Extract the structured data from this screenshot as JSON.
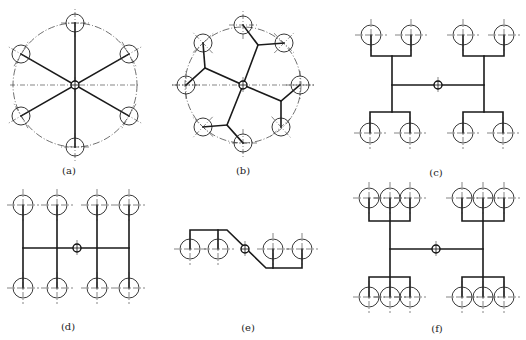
{
  "figure": {
    "title_cutoff": "",
    "panels": [
      {
        "id": "a",
        "label": "(a)",
        "label_pos": [
          69,
          170
        ],
        "type": "radial",
        "hub": [
          75,
          85
        ],
        "pcd_radius": 62,
        "center_line": {
          "x1": 10,
          "x2": 140,
          "y": 85
        },
        "outlets": [
          [
            75,
            23
          ],
          [
            129,
            54
          ],
          [
            129,
            116
          ],
          [
            75,
            147
          ],
          [
            21,
            116
          ],
          [
            21,
            54
          ]
        ],
        "branches": [
          [
            [
              75,
              85
            ],
            [
              75,
              23
            ]
          ],
          [
            [
              75,
              85
            ],
            [
              129,
              54
            ]
          ],
          [
            [
              75,
              85
            ],
            [
              129,
              116
            ]
          ],
          [
            [
              75,
              85
            ],
            [
              75,
              147
            ]
          ],
          [
            [
              75,
              85
            ],
            [
              21,
              116
            ]
          ],
          [
            [
              75,
              85
            ],
            [
              21,
              54
            ]
          ]
        ]
      },
      {
        "id": "b",
        "label": "(b)",
        "label_pos": [
          243,
          170
        ],
        "type": "radial-branched",
        "hub": [
          243,
          85
        ],
        "pcd_radius": 58,
        "center_line": {
          "x1": 172,
          "x2": 314,
          "y": 85
        },
        "outlets": [
          [
            243,
            25
          ],
          [
            284,
            43
          ],
          [
            300,
            85
          ],
          [
            281,
            127
          ],
          [
            243,
            143
          ],
          [
            203,
            127
          ],
          [
            186,
            85
          ],
          [
            203,
            43
          ]
        ],
        "branches": [
          [
            [
              243,
              85
            ],
            [
              258,
              45
            ],
            [
              243,
              25
            ]
          ],
          [
            [
              258,
              45
            ],
            [
              284,
              43
            ]
          ],
          [
            [
              243,
              85
            ],
            [
              281,
              101
            ],
            [
              300,
              85
            ]
          ],
          [
            [
              281,
              101
            ],
            [
              281,
              127
            ]
          ],
          [
            [
              243,
              85
            ],
            [
              227,
              125
            ],
            [
              243,
              143
            ]
          ],
          [
            [
              227,
              125
            ],
            [
              203,
              127
            ]
          ],
          [
            [
              243,
              85
            ],
            [
              205,
              68
            ],
            [
              186,
              85
            ]
          ],
          [
            [
              205,
              68
            ],
            [
              203,
              43
            ]
          ]
        ]
      },
      {
        "id": "c",
        "label": "(c)",
        "label_pos": [
          436,
          172
        ],
        "type": "H-tree-4x2",
        "hub": [
          438,
          85
        ],
        "outlets": [
          [
            371,
            35
          ],
          [
            411,
            35
          ],
          [
            463,
            35
          ],
          [
            504,
            35
          ],
          [
            370,
            133
          ],
          [
            410,
            133
          ],
          [
            463,
            133
          ],
          [
            503,
            133
          ]
        ],
        "branches": [
          [
            [
              392,
              85
            ],
            [
              484,
              85
            ]
          ],
          [
            [
              392,
              56
            ],
            [
              392,
              112
            ]
          ],
          [
            [
              484,
              56
            ],
            [
              484,
              112
            ]
          ],
          [
            [
              371,
              35
            ],
            [
              371,
              56
            ],
            [
              411,
              56
            ],
            [
              411,
              35
            ]
          ],
          [
            [
              463,
              35
            ],
            [
              463,
              56
            ],
            [
              504,
              56
            ],
            [
              504,
              35
            ]
          ],
          [
            [
              370,
              133
            ],
            [
              370,
              112
            ],
            [
              410,
              112
            ],
            [
              410,
              133
            ]
          ],
          [
            [
              463,
              133
            ],
            [
              463,
              112
            ],
            [
              503,
              112
            ],
            [
              503,
              133
            ]
          ]
        ]
      },
      {
        "id": "d",
        "label": "(d)",
        "label_pos": [
          68,
          326
        ],
        "type": "comb-4x2",
        "hub": [
          77,
          248
        ],
        "outlets": [
          [
            23,
            205
          ],
          [
            57,
            205
          ],
          [
            97,
            205
          ],
          [
            129,
            205
          ],
          [
            23,
            288
          ],
          [
            57,
            288
          ],
          [
            97,
            288
          ],
          [
            129,
            288
          ]
        ],
        "branches": [
          [
            [
              23,
              248
            ],
            [
              129,
              248
            ]
          ],
          [
            [
              23,
              205
            ],
            [
              23,
              288
            ]
          ],
          [
            [
              57,
              205
            ],
            [
              57,
              288
            ]
          ],
          [
            [
              97,
              205
            ],
            [
              97,
              288
            ]
          ],
          [
            [
              129,
              205
            ],
            [
              129,
              288
            ]
          ]
        ]
      },
      {
        "id": "e",
        "label": "(e)",
        "label_pos": [
          248,
          327
        ],
        "type": "offset-linear",
        "hub": [
          245,
          249
        ],
        "outlets": [
          [
            190,
            249
          ],
          [
            218,
            249
          ],
          [
            273,
            249
          ],
          [
            302,
            249
          ]
        ],
        "branches": [
          [
            [
              190,
              249
            ],
            [
              190,
              230
            ],
            [
              227,
              230
            ],
            [
              266,
              268
            ],
            [
              302,
              268
            ],
            [
              302,
              249
            ]
          ],
          [
            [
              218,
              230
            ],
            [
              218,
              249
            ]
          ],
          [
            [
              273,
              268
            ],
            [
              273,
              249
            ]
          ]
        ]
      },
      {
        "id": "f",
        "label": "(f)",
        "label_pos": [
          437,
          328
        ],
        "type": "H-tree-6x2",
        "hub": [
          436,
          249
        ],
        "outlets": [
          [
            369,
            198
          ],
          [
            390,
            198
          ],
          [
            410,
            198
          ],
          [
            462,
            198
          ],
          [
            483,
            198
          ],
          [
            504,
            198
          ],
          [
            369,
            297
          ],
          [
            390,
            297
          ],
          [
            410,
            297
          ],
          [
            462,
            297
          ],
          [
            483,
            297
          ],
          [
            504,
            297
          ]
        ],
        "branches": [
          [
            [
              390,
              249
            ],
            [
              483,
              249
            ]
          ],
          [
            [
              390,
              198
            ],
            [
              390,
              297
            ]
          ],
          [
            [
              483,
              198
            ],
            [
              483,
              297
            ]
          ],
          [
            [
              369,
              198
            ],
            [
              369,
              221
            ],
            [
              410,
              221
            ],
            [
              410,
              198
            ]
          ],
          [
            [
              462,
              198
            ],
            [
              462,
              221
            ],
            [
              504,
              221
            ],
            [
              504,
              198
            ]
          ],
          [
            [
              369,
              297
            ],
            [
              369,
              277
            ],
            [
              410,
              277
            ],
            [
              410,
              297
            ]
          ],
          [
            [
              462,
              297
            ],
            [
              462,
              277
            ],
            [
              504,
              277
            ],
            [
              504,
              297
            ]
          ]
        ]
      }
    ],
    "style": {
      "outlet_radius": 10,
      "outlet_radius_small": 9,
      "hub_radius": 4,
      "crosshair_extent": 16,
      "line_color": "#1a1a1a",
      "background": "#ffffff"
    }
  }
}
